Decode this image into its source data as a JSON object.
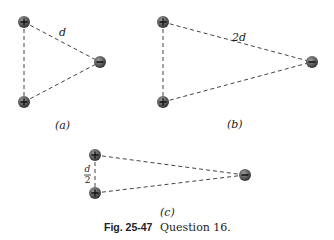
{
  "figure": {
    "number": "Fig. 25-47",
    "caption": "Question 16."
  },
  "panels": [
    {
      "id": "a",
      "label": "(a)",
      "distance_label": "d",
      "charges": [
        {
          "sign": "+",
          "x": 24,
          "y": 22
        },
        {
          "sign": "+",
          "x": 24,
          "y": 102
        },
        {
          "sign": "-",
          "x": 100,
          "y": 62
        }
      ]
    },
    {
      "id": "b",
      "label": "(b)",
      "distance_label": "2d",
      "charges": [
        {
          "sign": "+",
          "x": 163,
          "y": 22
        },
        {
          "sign": "+",
          "x": 163,
          "y": 102
        },
        {
          "sign": "-",
          "x": 312,
          "y": 62
        }
      ]
    },
    {
      "id": "c",
      "label": "(c)",
      "distance_label_num": "d",
      "distance_label_den": "2",
      "charges": [
        {
          "sign": "+",
          "x": 95,
          "y": 155
        },
        {
          "sign": "+",
          "x": 95,
          "y": 193
        },
        {
          "sign": "-",
          "x": 245,
          "y": 175
        }
      ]
    }
  ],
  "colors": {
    "charge_fill": "#6a6a6a",
    "charge_dark": "#3c3c3c",
    "line": "#444444"
  }
}
